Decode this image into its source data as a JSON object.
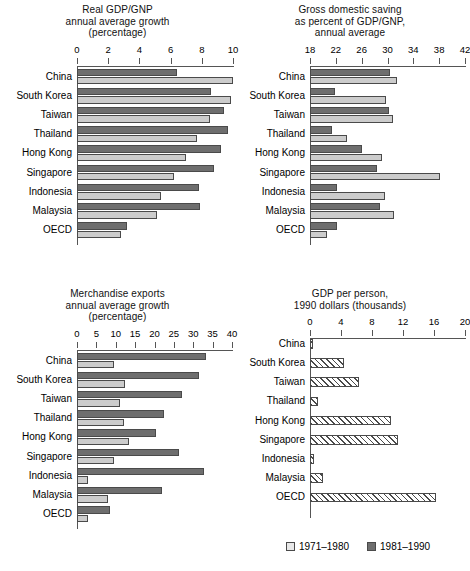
{
  "figure": {
    "legend": {
      "entries": [
        {
          "label": "1971–1980",
          "style": "light",
          "color": "#e8e8e8"
        },
        {
          "label": "1981–1990",
          "style": "dark",
          "color": "#6e6e6e"
        }
      ]
    },
    "categories": [
      "China",
      "South Korea",
      "Taiwan",
      "Thailand",
      "Hong Kong",
      "Singapore",
      "Indonesia",
      "Malaysia",
      "OECD"
    ]
  },
  "chart_data": [
    {
      "id": "real-gdp-growth",
      "type": "bar",
      "orientation": "horizontal",
      "title": "Real GDP/GNP\nannual average growth\n(percentage)",
      "title_lines": [
        "Real GDP/GNP",
        "annual average growth",
        "(percentage)"
      ],
      "xlabel": "",
      "ylabel": "",
      "xlim": [
        0,
        10
      ],
      "xticks": [
        0,
        2,
        4,
        6,
        8,
        10
      ],
      "grid": false,
      "legend_position": "figure-bottom-right",
      "categories": [
        "China",
        "South Korea",
        "Taiwan",
        "Thailand",
        "Hong Kong",
        "Singapore",
        "Indonesia",
        "Malaysia",
        "OECD"
      ],
      "series": [
        {
          "name": "1971–1980",
          "style": "light",
          "values": [
            10.0,
            9.9,
            8.5,
            7.7,
            7.0,
            6.2,
            5.4,
            5.1,
            2.8
          ]
        },
        {
          "name": "1981–1990",
          "style": "dark",
          "values": [
            6.4,
            8.6,
            9.4,
            9.7,
            9.2,
            8.8,
            7.8,
            7.9,
            3.2
          ]
        }
      ]
    },
    {
      "id": "gross-domestic-saving",
      "type": "bar",
      "orientation": "horizontal",
      "title": "Gross domestic saving\nas percent of GDP/GNP,\nannual average",
      "title_lines": [
        "Gross domestic saving",
        "as percent of GDP/GNP,",
        "annual average"
      ],
      "xlabel": "",
      "ylabel": "",
      "xlim": [
        18,
        42
      ],
      "xticks": [
        18,
        22,
        26,
        30,
        34,
        38,
        42
      ],
      "grid": false,
      "categories": [
        "China",
        "South Korea",
        "Taiwan",
        "Thailand",
        "Hong Kong",
        "Singapore",
        "Indonesia",
        "Malaysia",
        "OECD"
      ],
      "series": [
        {
          "name": "1971–1980",
          "style": "light",
          "values": [
            31.4,
            29.8,
            30.8,
            23.8,
            29.2,
            38.2,
            29.6,
            31.0,
            20.6
          ]
        },
        {
          "name": "1981–1990",
          "style": "dark",
          "values": [
            30.4,
            21.8,
            30.2,
            21.4,
            26.0,
            28.4,
            22.2,
            28.8,
            22.2
          ]
        }
      ]
    },
    {
      "id": "merchandise-exports-growth",
      "type": "bar",
      "orientation": "horizontal",
      "title": "Merchandise exports\nannual average growth\n(percentage)",
      "title_lines": [
        "Merchandise exports",
        "annual average growth",
        "(percentage)"
      ],
      "xlabel": "",
      "ylabel": "",
      "xlim": [
        0,
        40
      ],
      "xticks": [
        0,
        5,
        10,
        15,
        20,
        25,
        30,
        35,
        40
      ],
      "grid": false,
      "categories": [
        "China",
        "South Korea",
        "Taiwan",
        "Thailand",
        "Hong Kong",
        "Singapore",
        "Indonesia",
        "Malaysia",
        "OECD"
      ],
      "series": [
        {
          "name": "1971–1980",
          "style": "light",
          "values": [
            9.6,
            12.3,
            11.2,
            12.0,
            13.4,
            9.5,
            2.9,
            7.9,
            2.8
          ]
        },
        {
          "name": "1981–1990",
          "style": "dark",
          "values": [
            33.2,
            31.6,
            27.0,
            22.5,
            20.4,
            26.3,
            32.8,
            22.0,
            8.6
          ]
        }
      ]
    },
    {
      "id": "gdp-per-person",
      "type": "bar",
      "orientation": "horizontal",
      "title": "GDP per person,\n1990 dollars (thousands)",
      "title_lines": [
        "GDP per person,",
        "1990 dollars (thousands)"
      ],
      "xlabel": "",
      "ylabel": "",
      "xlim": [
        0,
        20
      ],
      "xticks": [
        0,
        4,
        8,
        12,
        16,
        20
      ],
      "grid": false,
      "categories": [
        "China",
        "South Korea",
        "Taiwan",
        "Thailand",
        "Hong Kong",
        "Singapore",
        "Indonesia",
        "Malaysia",
        "OECD"
      ],
      "series": [
        {
          "name": "GDP per person",
          "style": "hatch",
          "values": [
            0.35,
            4.4,
            6.3,
            1.0,
            10.4,
            11.3,
            0.5,
            1.7,
            16.3
          ]
        }
      ]
    }
  ]
}
